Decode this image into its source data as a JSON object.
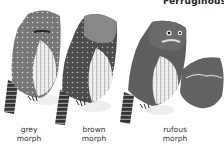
{
  "header": {
    "title_fragment": "Ferruginous Py"
  },
  "figures": [
    {
      "id": "grey",
      "label_line1": "grey",
      "label_line2": "morph"
    },
    {
      "id": "brown",
      "label_line1": "brown",
      "label_line2": "morph"
    },
    {
      "id": "rufous",
      "label_line1": "rufous",
      "label_line2": "morph"
    },
    {
      "id": "flight-pose",
      "label_line1": "",
      "label_line2": ""
    }
  ],
  "colors": {
    "background": "#ffffff",
    "grey_body": "#7a7a7a",
    "brown_body": "#555555",
    "rufous_body": "#5e5e5e",
    "belly": "#e6e6e6",
    "tail": "#3a3a3a",
    "perch": "#ececec"
  }
}
